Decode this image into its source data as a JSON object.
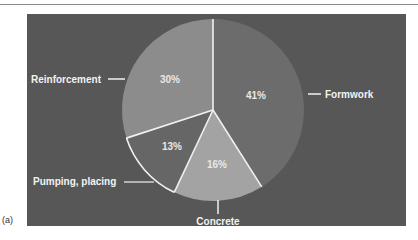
{
  "figure": {
    "label": "(a)"
  },
  "chart_data": {
    "type": "pie",
    "title": "",
    "start_angle_deg": 0,
    "direction": "clockwise",
    "categories": [
      "Formwork",
      "Concrete",
      "Pumping, placing",
      "Reinforcement"
    ],
    "values": [
      41,
      16,
      13,
      30
    ],
    "value_labels": [
      "41%",
      "16%",
      "13%",
      "30%"
    ],
    "colors": [
      "#6c6c6c",
      "#a3a3a3",
      "#666666",
      "#8c8c8c"
    ],
    "background": "#575757",
    "slice_border": "#f0f0f0",
    "legend": "none (callout labels)"
  }
}
